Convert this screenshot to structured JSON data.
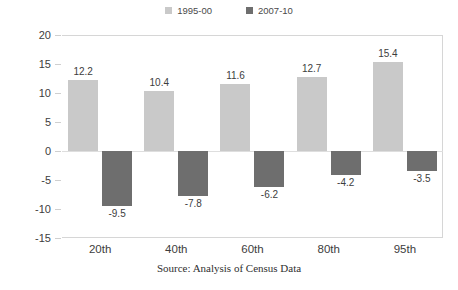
{
  "chart_data": {
    "type": "bar",
    "title": "",
    "xlabel": "",
    "ylabel": "Percent",
    "ylim": [
      -15,
      20
    ],
    "yticks": [
      20,
      15,
      10,
      5,
      0,
      -5,
      -10,
      -15
    ],
    "ytick_labels": [
      "20",
      "15",
      "10",
      "5",
      "0",
      "-5",
      "-10",
      "-15"
    ],
    "grid": false,
    "legend_position": "top-center",
    "categories": [
      "20th",
      "40th",
      "60th",
      "80th",
      "95th"
    ],
    "series": [
      {
        "name": "1995-00",
        "color": "#c9c9c9",
        "values": [
          12.2,
          10.4,
          11.6,
          12.7,
          15.4
        ],
        "value_labels": [
          "12.2",
          "10.4",
          "11.6",
          "12.7",
          "15.4"
        ]
      },
      {
        "name": "2007-10",
        "color": "#6e6e6e",
        "values": [
          -9.5,
          -7.8,
          -6.2,
          -4.2,
          -3.5
        ],
        "value_labels": [
          "-9.5",
          "-7.8",
          "-6.2",
          "-4.2",
          "-3.5"
        ]
      }
    ],
    "annotations": [
      "Source: Analysis of Census Data"
    ]
  },
  "legend": {
    "entries": [
      {
        "label": "1995-00",
        "color": "#c9c9c9"
      },
      {
        "label": "2007-10",
        "color": "#6e6e6e"
      }
    ]
  },
  "axes": {
    "y_title": "Percent"
  },
  "footer": {
    "source": "Source: Analysis of Census Data"
  }
}
